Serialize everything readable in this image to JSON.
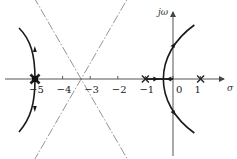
{
  "diagram": {
    "type": "root-locus",
    "axes": {
      "real_label": "σ",
      "imag_label": "jω",
      "x_range": [
        -6.1,
        1.8
      ],
      "ticks": [
        {
          "value": -5,
          "label": "−5"
        },
        {
          "value": -4,
          "label": "−4"
        },
        {
          "value": -3,
          "label": "−3"
        },
        {
          "value": -2,
          "label": "−2"
        },
        {
          "value": -1,
          "label": "−1"
        },
        {
          "value": 0,
          "label": "0"
        },
        {
          "value": 1,
          "label": "1"
        }
      ]
    },
    "poles": [
      {
        "value": -5,
        "marker": "x",
        "emphasis": "bold"
      },
      {
        "value": -1,
        "marker": "x"
      },
      {
        "value": 1,
        "marker": "x"
      }
    ],
    "asymptotes": {
      "centroid": -3.33,
      "angles_deg": [
        60,
        180,
        -60
      ],
      "style": "dash-dot",
      "color": "#888888"
    },
    "breakaway_point": -0.35,
    "branches": [
      {
        "name": "left-branch",
        "from": -5,
        "direction": "to -infinity along 180° while splitting"
      },
      {
        "name": "right-branch",
        "from": -0.35,
        "direction": "toward ±60° asymptotes"
      }
    ],
    "colors": {
      "axis": "#555555",
      "locus": "#1a1a1a",
      "asymptote": "#888888"
    }
  }
}
